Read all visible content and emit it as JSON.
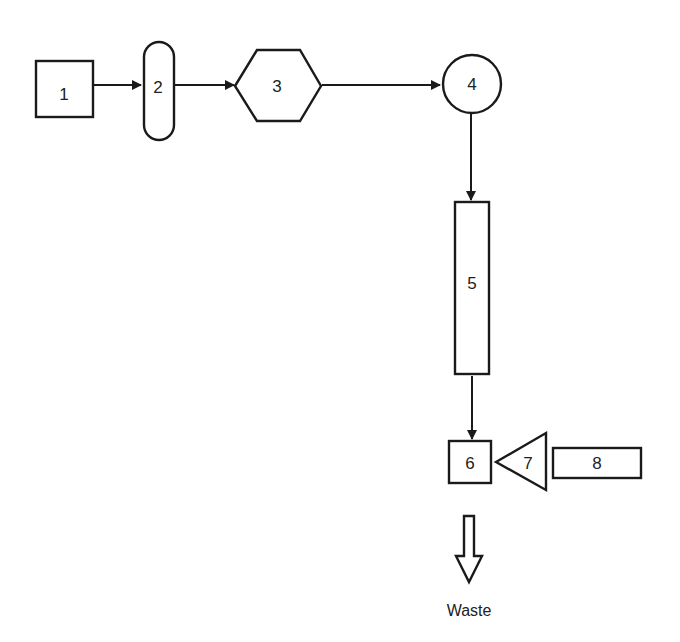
{
  "diagram": {
    "type": "process-flow",
    "colors": {
      "stroke": "#1a1a1a",
      "fill": "#ffffff",
      "text": "#222222"
    },
    "nodes": [
      {
        "id": "1",
        "label": "1",
        "shape": "square"
      },
      {
        "id": "2",
        "label": "2",
        "shape": "rounded-capsule"
      },
      {
        "id": "3",
        "label": "3",
        "shape": "hexagon"
      },
      {
        "id": "4",
        "label": "4",
        "shape": "circle"
      },
      {
        "id": "5",
        "label": "5",
        "shape": "tall-rectangle"
      },
      {
        "id": "6",
        "label": "6",
        "shape": "square"
      },
      {
        "id": "7",
        "label": "7",
        "shape": "triangle"
      },
      {
        "id": "8",
        "label": "8",
        "shape": "wide-rectangle"
      }
    ],
    "edges": [
      {
        "from": "1",
        "to": "2"
      },
      {
        "from": "2",
        "to": "3"
      },
      {
        "from": "3",
        "to": "4"
      },
      {
        "from": "4",
        "to": "5"
      },
      {
        "from": "5",
        "to": "6"
      },
      {
        "from": "8",
        "to": "6",
        "via": "7"
      }
    ],
    "output": {
      "label": "Waste",
      "icon": "hollow-arrow-down-icon"
    }
  }
}
